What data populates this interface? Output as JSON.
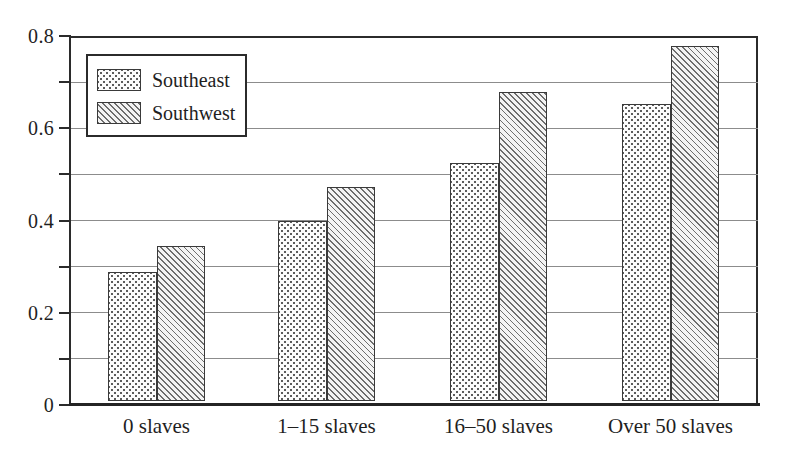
{
  "chart_data": {
    "type": "bar",
    "title": "",
    "subtitle": "",
    "xlabel": "",
    "ylabel": "",
    "categories": [
      "0 slaves",
      "1–15 slaves",
      "16–50 slaves",
      "Over 50 slaves"
    ],
    "series": [
      {
        "name": "Southeast",
        "values": [
          0.28,
          0.39,
          0.515,
          0.645
        ],
        "fill": "dotted",
        "color": "#fdfdfd"
      },
      {
        "name": "Southwest",
        "values": [
          0.335,
          0.465,
          0.67,
          0.77
        ],
        "fill": "diagonal-hatch",
        "color": "#f2f2f2"
      }
    ],
    "ylim": [
      0,
      0.8
    ],
    "ytick_values": [
      0,
      0.1,
      0.2,
      0.3,
      0.4,
      0.5,
      0.6,
      0.7,
      0.8
    ],
    "ytick_labels": [
      "0",
      "",
      "0.2",
      "",
      "0.4",
      "",
      "0.6",
      "",
      "0.8"
    ],
    "gridlines": true,
    "grid_axis": "y",
    "grid_interval": 0.1,
    "legend": {
      "position": "top-left",
      "entries": [
        "Southeast",
        "Southwest"
      ]
    },
    "bar_border_color": "#3a3a3a",
    "axis_color": "#2b2b2b",
    "grid_color": "#8c8c8c",
    "background": "#ffffff"
  },
  "axis": {
    "y_labels": [
      {
        "value": 0.8,
        "text": "0.8"
      },
      {
        "value": 0.6,
        "text": "0.6"
      },
      {
        "value": 0.4,
        "text": "0.4"
      },
      {
        "value": 0.2,
        "text": "0.2"
      },
      {
        "value": 0,
        "text": "0"
      }
    ],
    "x_labels": [
      "0 slaves",
      "1–15 slaves",
      "16–50 slaves",
      "Over 50 slaves"
    ]
  },
  "legend": {
    "items": [
      {
        "label": "Southeast",
        "pattern": "dotted"
      },
      {
        "label": "Southwest",
        "pattern": "diagonal-hatch"
      }
    ]
  }
}
